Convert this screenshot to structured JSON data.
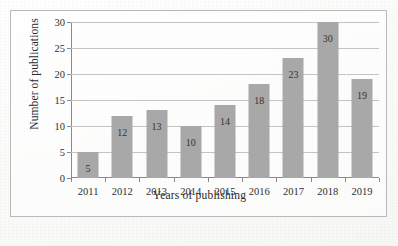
{
  "chart_data": {
    "type": "bar",
    "title": "",
    "xlabel": "Years of publishing",
    "ylabel": "Number of publications",
    "categories": [
      "2011",
      "2012",
      "2013",
      "2014",
      "2015",
      "2016",
      "2017",
      "2018",
      "2019"
    ],
    "values": [
      5,
      12,
      13,
      10,
      14,
      18,
      23,
      30,
      19
    ],
    "value_labels": [
      "5",
      "12",
      "13",
      "10",
      "14",
      "18",
      "23",
      "30",
      "19"
    ],
    "ylim": [
      0,
      30
    ],
    "y_ticks": [
      0,
      5,
      10,
      15,
      20,
      25,
      30
    ],
    "y_tick_labels": [
      "0",
      "5",
      "10",
      "15",
      "20",
      "25",
      "30"
    ],
    "grid": "horizontal",
    "legend": "none",
    "series": [
      {
        "name": "Number of publications",
        "values": [
          5,
          12,
          13,
          10,
          14,
          18,
          23,
          30,
          19
        ]
      }
    ],
    "colors": {
      "bar_fill": "#a8a8a8",
      "gridline": "#c4c4c4",
      "axis_line": "#8a8a8a",
      "frame_border": "#b9b9b9",
      "text": "#2b2b2b",
      "background": "#fdfdfc"
    }
  }
}
